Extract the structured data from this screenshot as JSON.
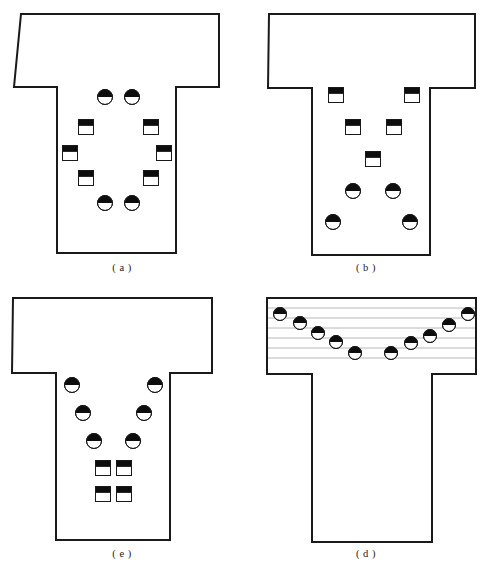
{
  "figure": {
    "background": "#ffffff",
    "outline_color": "#1a1a1a",
    "marker_fill_dark": "#0d0d0d",
    "marker_fill_light": "#ffffff",
    "gridline_color": "#b8b8b8",
    "trimmed_caption": "",
    "panels": [
      {
        "id": "a",
        "caption": "( a )",
        "x": 0,
        "y": 0,
        "outline": "21,14 219,14 219,87 176,87 176,253 57,253 57,87 14,87",
        "gridlines": [],
        "markers": [
          {
            "shape": "circle",
            "cx": 105,
            "cy": 97,
            "r": 7.5,
            "name": "marker-circle-1"
          },
          {
            "shape": "circle",
            "cx": 132,
            "cy": 97,
            "r": 7.5,
            "name": "marker-circle-2"
          },
          {
            "shape": "square",
            "cx": 86,
            "cy": 127,
            "r": 7.5,
            "name": "marker-square-1"
          },
          {
            "shape": "square",
            "cx": 151,
            "cy": 127,
            "r": 7.5,
            "name": "marker-square-2"
          },
          {
            "shape": "square",
            "cx": 70,
            "cy": 153,
            "r": 7.5,
            "name": "marker-square-3"
          },
          {
            "shape": "square",
            "cx": 164,
            "cy": 153,
            "r": 7.5,
            "name": "marker-square-4"
          },
          {
            "shape": "square",
            "cx": 86,
            "cy": 178,
            "r": 7.5,
            "name": "marker-square-5"
          },
          {
            "shape": "square",
            "cx": 151,
            "cy": 178,
            "r": 7.5,
            "name": "marker-square-6"
          },
          {
            "shape": "circle",
            "cx": 105,
            "cy": 203,
            "r": 7.5,
            "name": "marker-circle-3"
          },
          {
            "shape": "circle",
            "cx": 132,
            "cy": 203,
            "r": 7.5,
            "name": "marker-circle-4"
          }
        ]
      },
      {
        "id": "b",
        "caption": "( b )",
        "x": 244,
        "y": 0,
        "outline": "25,14 231,14 231,88 186,88 186,255 68,255 68,88 24,88",
        "gridlines": [],
        "markers": [
          {
            "shape": "square",
            "cx": 92,
            "cy": 95,
            "r": 7.5,
            "name": "marker-square-1"
          },
          {
            "shape": "square",
            "cx": 168,
            "cy": 95,
            "r": 7.5,
            "name": "marker-square-2"
          },
          {
            "shape": "square",
            "cx": 109,
            "cy": 127,
            "r": 7.5,
            "name": "marker-square-3"
          },
          {
            "shape": "square",
            "cx": 150,
            "cy": 127,
            "r": 7.5,
            "name": "marker-square-4"
          },
          {
            "shape": "square",
            "cx": 129,
            "cy": 159,
            "r": 7.5,
            "name": "marker-square-5"
          },
          {
            "shape": "circle",
            "cx": 109,
            "cy": 191,
            "r": 7.5,
            "name": "marker-circle-1"
          },
          {
            "shape": "circle",
            "cx": 149,
            "cy": 191,
            "r": 7.5,
            "name": "marker-circle-2"
          },
          {
            "shape": "circle",
            "cx": 89,
            "cy": 222,
            "r": 7.5,
            "name": "marker-circle-3"
          },
          {
            "shape": "circle",
            "cx": 166,
            "cy": 222,
            "r": 7.5,
            "name": "marker-circle-4"
          }
        ]
      },
      {
        "id": "c",
        "caption": "( e )",
        "x": 0,
        "y": 286,
        "outline": "13,12 212,12 212,87 170,87 170,254 56,254 56,87 12,87",
        "gridlines": [],
        "markers": [
          {
            "shape": "circle",
            "cx": 72,
            "cy": 99,
            "r": 7.5,
            "name": "marker-circle-1"
          },
          {
            "shape": "circle",
            "cx": 155,
            "cy": 99,
            "r": 7.5,
            "name": "marker-circle-2"
          },
          {
            "shape": "circle",
            "cx": 83,
            "cy": 127,
            "r": 7.5,
            "name": "marker-circle-3"
          },
          {
            "shape": "circle",
            "cx": 144,
            "cy": 127,
            "r": 7.5,
            "name": "marker-circle-4"
          },
          {
            "shape": "circle",
            "cx": 94,
            "cy": 155,
            "r": 7.5,
            "name": "marker-circle-5"
          },
          {
            "shape": "circle",
            "cx": 133,
            "cy": 155,
            "r": 7.5,
            "name": "marker-circle-6"
          },
          {
            "shape": "square",
            "cx": 103,
            "cy": 182,
            "r": 7.5,
            "name": "marker-square-1"
          },
          {
            "shape": "square",
            "cx": 124,
            "cy": 182,
            "r": 7.5,
            "name": "marker-square-2"
          },
          {
            "shape": "square",
            "cx": 103,
            "cy": 208,
            "r": 7.5,
            "name": "marker-square-3"
          },
          {
            "shape": "square",
            "cx": 124,
            "cy": 208,
            "r": 7.5,
            "name": "marker-square-4"
          }
        ]
      },
      {
        "id": "d",
        "caption": "( d )",
        "x": 244,
        "y": 286,
        "outline": "23,12 232,12 232,88 188,88 188,256 68,256 68,88 23,88",
        "gridlines": [
          {
            "x1": 23,
            "y1": 22,
            "x2": 232,
            "y2": 22
          },
          {
            "x1": 23,
            "y1": 32,
            "x2": 232,
            "y2": 32
          },
          {
            "x1": 23,
            "y1": 42,
            "x2": 232,
            "y2": 42
          },
          {
            "x1": 23,
            "y1": 52,
            "x2": 232,
            "y2": 52
          },
          {
            "x1": 23,
            "y1": 62,
            "x2": 232,
            "y2": 62
          },
          {
            "x1": 23,
            "y1": 72,
            "x2": 232,
            "y2": 72
          }
        ],
        "markers": [
          {
            "shape": "circle",
            "cx": 36,
            "cy": 28,
            "r": 6.5,
            "name": "marker-circle-1"
          },
          {
            "shape": "circle",
            "cx": 56,
            "cy": 37,
            "r": 6.5,
            "name": "marker-circle-2"
          },
          {
            "shape": "circle",
            "cx": 74,
            "cy": 47,
            "r": 6.5,
            "name": "marker-circle-3"
          },
          {
            "shape": "circle",
            "cx": 92,
            "cy": 56,
            "r": 6.5,
            "name": "marker-circle-4"
          },
          {
            "shape": "circle",
            "cx": 111,
            "cy": 67,
            "r": 6.5,
            "name": "marker-circle-5"
          },
          {
            "shape": "circle",
            "cx": 147,
            "cy": 67,
            "r": 6.5,
            "name": "marker-circle-6"
          },
          {
            "shape": "circle",
            "cx": 167,
            "cy": 57,
            "r": 6.5,
            "name": "marker-circle-7"
          },
          {
            "shape": "circle",
            "cx": 186,
            "cy": 50,
            "r": 6.5,
            "name": "marker-circle-8"
          },
          {
            "shape": "circle",
            "cx": 205,
            "cy": 39,
            "r": 6.5,
            "name": "marker-circle-9"
          },
          {
            "shape": "circle",
            "cx": 224,
            "cy": 28,
            "r": 6.5,
            "name": "marker-circle-10"
          }
        ]
      }
    ]
  }
}
